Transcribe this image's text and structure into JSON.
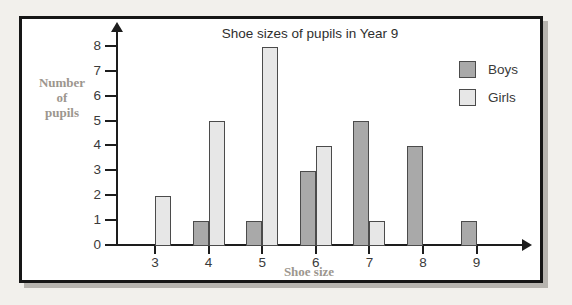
{
  "page": {
    "background": "#f2f0ec"
  },
  "panel": {
    "background": "#ffffff",
    "border_color": "#161616",
    "shadow_color": "#b7b4af"
  },
  "chart_data": {
    "type": "bar",
    "title": "Shoe sizes of pupils in Year 9",
    "xlabel": "Shoe size",
    "ylabel": "Number of pupils",
    "ylabel_lines": [
      "Number",
      "of",
      "pupils"
    ],
    "categories": [
      "3",
      "4",
      "5",
      "6",
      "7",
      "8",
      "9"
    ],
    "series": [
      {
        "name": "Boys",
        "color": "#a9a9a9",
        "values": [
          0,
          1,
          1,
          3,
          5,
          4,
          1
        ]
      },
      {
        "name": "Girls",
        "color": "#e7e7e7",
        "values": [
          2,
          5,
          8,
          4,
          1,
          0,
          0
        ]
      }
    ],
    "ylim": [
      0,
      8
    ],
    "yticks": [
      0,
      1,
      2,
      3,
      4,
      5,
      6,
      7,
      8
    ],
    "grid": false,
    "legend_position": "upper-right",
    "legend_labels": [
      "Boys",
      "Girls"
    ],
    "colors": {
      "bar_border": "#4b4b4b",
      "axis": "#1d1d1d",
      "axis_label": "#9c968e",
      "tick_label": "#3a3a3a",
      "title": "#2e2e2e"
    }
  }
}
